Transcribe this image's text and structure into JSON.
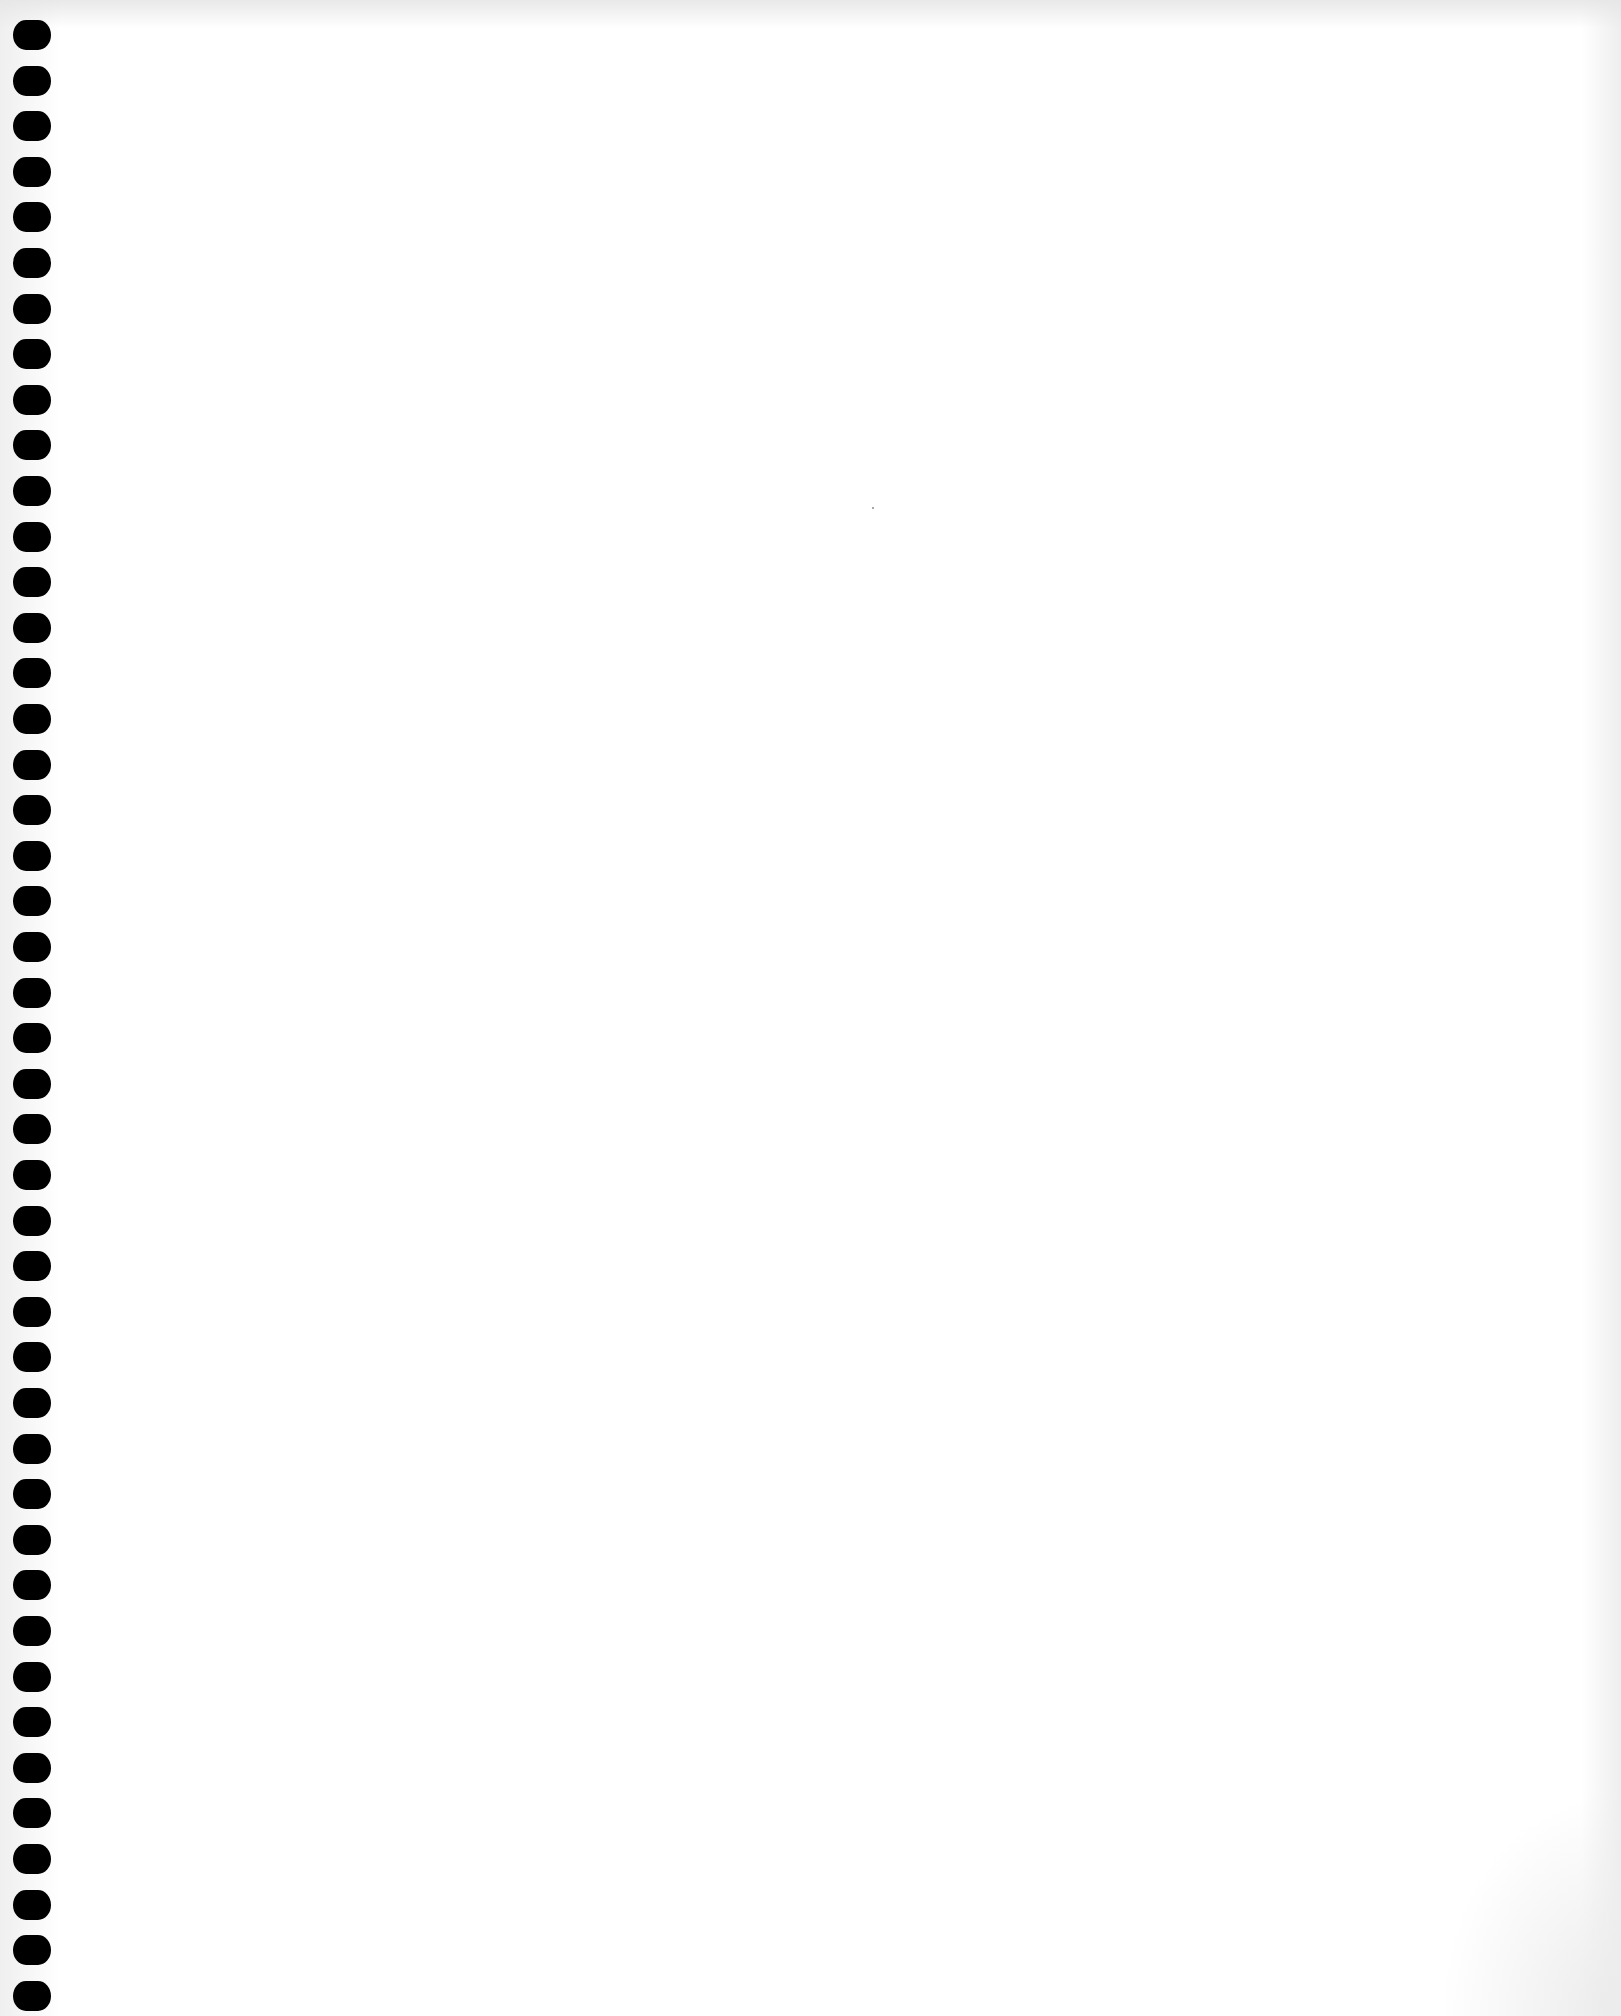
{
  "page": {
    "type": "blank-notebook-page",
    "background_color": "#ffffff",
    "text_content": []
  },
  "binding": {
    "hole_count": 44,
    "hole_color": "#000000",
    "hole_spacing_px": 45.6,
    "first_hole_top_px": 0
  }
}
